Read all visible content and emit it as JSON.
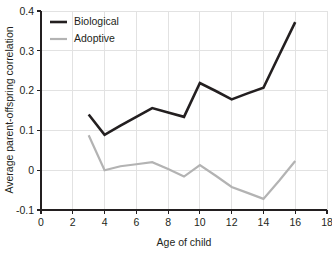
{
  "chart_data": {
    "type": "line",
    "title": "",
    "subtitle": "",
    "xlabel": "Age of child",
    "ylabel": "Average parent-offspring correlation",
    "xlim": [
      0,
      18
    ],
    "ylim": [
      -0.1,
      0.4
    ],
    "xticks": [
      0,
      2,
      4,
      6,
      8,
      10,
      12,
      14,
      16,
      18
    ],
    "xticklabels": [
      "0",
      "2",
      "4",
      "6",
      "8",
      "10",
      "12",
      "14",
      "16",
      "18"
    ],
    "yticks": [
      -0.1,
      0,
      0.1,
      0.2,
      0.3,
      0.4
    ],
    "yticklabels": [
      "-0.1",
      "0",
      "0.1",
      "0.2",
      "0.3",
      "0.4"
    ],
    "grid": true,
    "grid_axis": "both",
    "legend_position": "upper-left",
    "x": [
      3,
      4,
      5,
      6,
      7,
      8,
      9,
      10,
      11,
      12,
      13,
      14,
      15,
      16
    ],
    "series": [
      {
        "name": "Biological",
        "color": "#231f20",
        "linewidth": 2.6,
        "values": [
          0.14,
          0.089,
          0.112,
          0.134,
          0.156,
          0.145,
          0.134,
          0.219,
          0.199,
          0.178,
          0.193,
          0.207,
          0.29,
          0.372
        ]
      },
      {
        "name": "Adoptive",
        "color": "#b3b3b3",
        "linewidth": 2.2,
        "values": [
          0.088,
          0.0,
          0.01,
          0.015,
          0.02,
          0.003,
          -0.016,
          0.013,
          -0.014,
          -0.042,
          -0.057,
          -0.072,
          -0.026,
          0.023
        ]
      }
    ]
  },
  "legend": {
    "entries": [
      {
        "label": "Biological"
      },
      {
        "label": "Adoptive"
      }
    ]
  },
  "axes": {
    "x_title": "Age of child",
    "y_title": "Average parent-offspring correlation"
  }
}
